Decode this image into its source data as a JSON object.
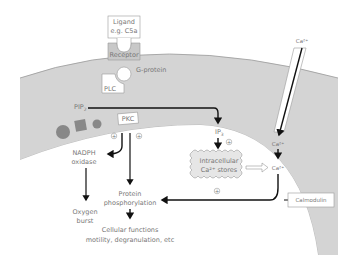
{
  "diagram": {
    "nodes": {
      "ligand_line1": "Ligand",
      "ligand_line2": "e.g. C5a",
      "receptor": "Receptor",
      "g_protein": "G-protein",
      "plc": "PLC",
      "pip2": "PIP",
      "pip2_sub": "2",
      "pkc": "PKC",
      "nadph_line1": "NADPH",
      "nadph_line2": "oxidase",
      "ip3": "IP",
      "ip3_sub": "3",
      "stores_line1": "Intracellular",
      "stores_line2": "Ca²⁺ stores",
      "ca_out": "Ca²⁺",
      "ca_in1": "Ca²⁺",
      "ca_in2": "Ca²⁺",
      "calmodulin": "Calmodulin",
      "protein_line1": "Protein",
      "protein_line2": "phosphorylation",
      "oxygen_line1": "Oxygen",
      "oxygen_line2": "burst",
      "cellular_line1": "Cellular functions",
      "cellular_line2": "motility, degranulation, etc"
    },
    "signs": {
      "pkc_left": "+",
      "pkc_right": "+",
      "ip3_sign": "+",
      "ca_sign": "+"
    },
    "colors": {
      "membrane": "#cfcfcf",
      "membrane_edge": "#999999",
      "arrow": "#111111",
      "text": "#777777",
      "box_fill": "#ffffff",
      "receptor_fill": "#c8c8c8",
      "protein_dark": "#888888"
    }
  }
}
